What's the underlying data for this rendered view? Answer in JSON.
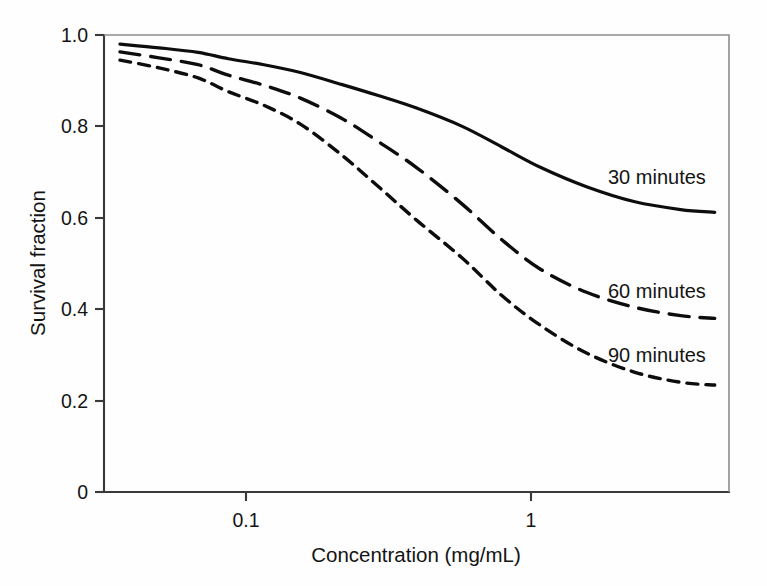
{
  "chart_data": {
    "type": "line",
    "title": "",
    "subtitle": "",
    "xlabel": "Concentration (mg/mL)",
    "ylabel": "Survival fraction",
    "xscale": "log",
    "yscale": "linear",
    "xlim": [
      0.04,
      4.0
    ],
    "ylim": [
      0,
      1.0
    ],
    "xticks": [
      0.1,
      1
    ],
    "xticklabels": [
      "0.1",
      "1"
    ],
    "yticks": [
      0,
      0.2,
      0.4,
      0.6,
      0.8,
      1.0
    ],
    "yticklabels": [
      "0",
      "0.2",
      "0.4",
      "0.6",
      "0.8",
      "1.0"
    ],
    "grid": false,
    "legend_position": "inline-right",
    "annotations": [
      "30 minutes",
      "60 minutes",
      "90 minutes"
    ],
    "x": [
      0.045,
      0.06,
      0.08,
      0.1,
      0.13,
      0.17,
      0.23,
      0.3,
      0.4,
      0.56,
      0.75,
      1.0,
      1.4,
      2.0,
      2.8,
      3.6
    ],
    "series": [
      {
        "name": "30 minutes",
        "label": "30 minutes",
        "style": "solid",
        "values": [
          0.98,
          0.972,
          0.962,
          0.948,
          0.935,
          0.918,
          0.892,
          0.868,
          0.84,
          0.8,
          0.755,
          0.71,
          0.668,
          0.635,
          0.618,
          0.612
        ]
      },
      {
        "name": "60 minutes",
        "label": "60 minutes",
        "style": "long-dash",
        "values": [
          0.963,
          0.95,
          0.935,
          0.912,
          0.89,
          0.862,
          0.818,
          0.768,
          0.71,
          0.63,
          0.552,
          0.487,
          0.437,
          0.404,
          0.386,
          0.38
        ]
      },
      {
        "name": "90 minutes",
        "label": "90 minutes",
        "style": "short-dash",
        "values": [
          0.945,
          0.928,
          0.906,
          0.876,
          0.846,
          0.805,
          0.738,
          0.67,
          0.595,
          0.512,
          0.43,
          0.364,
          0.304,
          0.262,
          0.24,
          0.234
        ]
      }
    ]
  },
  "axes": {
    "y_title": "Survival fraction",
    "x_title": "Concentration (mg/mL)"
  },
  "colors": {
    "line": "#0d0d0d",
    "axis": "#3a3a3a",
    "background": "#fefefe",
    "text": "#141414"
  },
  "labels": {
    "series_30": "30 minutes",
    "series_60": "60 minutes",
    "series_90": "90 minutes",
    "ytick_0": "0",
    "ytick_02": "0.2",
    "ytick_04": "0.4",
    "ytick_06": "0.6",
    "ytick_08": "0.8",
    "ytick_10": "1.0",
    "xtick_01": "0.1",
    "xtick_1": "1"
  }
}
